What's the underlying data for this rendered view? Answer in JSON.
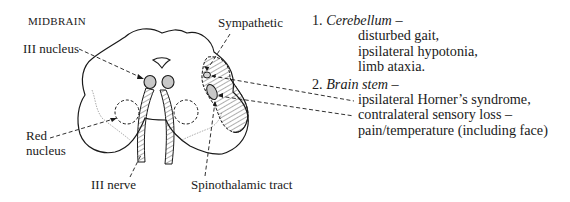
{
  "diagram": {
    "title": "MIDBRAIN",
    "labels": {
      "iii_nucleus": "III nucleus",
      "red_nucleus_line1": "Red",
      "red_nucleus_line2": "nucleus",
      "iii_nerve": "III nerve",
      "sympathetic": "Sympathetic",
      "spinothalamic": "Spinothalamic tract"
    }
  },
  "findings": [
    {
      "number": "1.",
      "region": "Cerebellum",
      "dash": "–",
      "items": [
        "disturbed gait,",
        "ipsilateral hypotonia,",
        "limb ataxia."
      ]
    },
    {
      "number": "2.",
      "region": "Brain stem",
      "dash": "–",
      "items": [
        "ipsilateral Horner’s syndrome,",
        "contralateral sensory loss –",
        "pain/temperature (including face)"
      ]
    }
  ],
  "colors": {
    "ink": "#1a1a1a",
    "nucleus_fill": "#c8c8c8",
    "lesion_hatch": "#333333"
  }
}
